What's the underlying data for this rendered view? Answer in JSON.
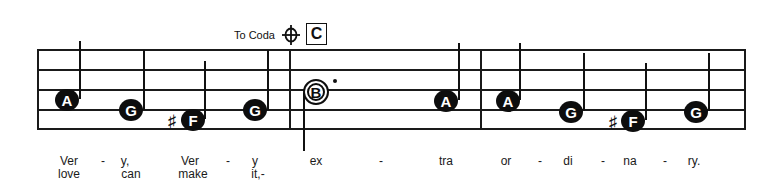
{
  "score": {
    "coda_marker": {
      "label": "To Coda",
      "icon": "coda-icon"
    },
    "rehearsal_mark": "C",
    "staff": {
      "lines": 5,
      "left": 38,
      "right": 746,
      "line_y": [
        50,
        70,
        90,
        110,
        129
      ]
    },
    "barlines_x": [
      38,
      290,
      481,
      745
    ],
    "notes": [
      {
        "letter": "A",
        "type": "quarter",
        "accidental": "",
        "x": 66,
        "y": 100,
        "stem": "up"
      },
      {
        "letter": "G",
        "type": "quarter",
        "accidental": "",
        "x": 131,
        "y": 110,
        "stem": "up"
      },
      {
        "letter": "F",
        "type": "quarter",
        "accidental": "♯",
        "x": 193,
        "y": 120,
        "stem": "up"
      },
      {
        "letter": "G",
        "type": "quarter",
        "accidental": "",
        "x": 255,
        "y": 110,
        "stem": "up"
      },
      {
        "letter": "B",
        "type": "dotted-half",
        "accidental": "",
        "x": 316,
        "y": 92,
        "stem": "down"
      },
      {
        "letter": "A",
        "type": "quarter",
        "accidental": "",
        "x": 446,
        "y": 101,
        "stem": "up"
      },
      {
        "letter": "A",
        "type": "quarter",
        "accidental": "",
        "x": 508,
        "y": 101,
        "stem": "up"
      },
      {
        "letter": "G",
        "type": "quarter",
        "accidental": "",
        "x": 571,
        "y": 112,
        "stem": "up"
      },
      {
        "letter": "F",
        "type": "quarter",
        "accidental": "♯",
        "x": 633,
        "y": 121,
        "stem": "up"
      },
      {
        "letter": "G",
        "type": "quarter",
        "accidental": "",
        "x": 696,
        "y": 112,
        "stem": "up"
      }
    ],
    "lyrics": {
      "verse1": [
        {
          "text": "Ver",
          "x": 69
        },
        {
          "text": "-",
          "x": 103
        },
        {
          "text": "y,",
          "x": 125
        },
        {
          "text": "Ver",
          "x": 190
        },
        {
          "text": "-",
          "x": 228
        },
        {
          "text": "y",
          "x": 255
        },
        {
          "text": "ex",
          "x": 316
        },
        {
          "text": "-",
          "x": 381
        },
        {
          "text": "tra",
          "x": 446
        },
        {
          "text": "or",
          "x": 506
        },
        {
          "text": "-",
          "x": 540
        },
        {
          "text": "di",
          "x": 568
        },
        {
          "text": "-",
          "x": 603
        },
        {
          "text": "na",
          "x": 630
        },
        {
          "text": "-",
          "x": 665
        },
        {
          "text": "ry.",
          "x": 694
        }
      ],
      "verse2": [
        {
          "text": "love",
          "x": 69
        },
        {
          "text": "can",
          "x": 131
        },
        {
          "text": "make",
          "x": 193
        },
        {
          "text": "it,-",
          "x": 258
        }
      ]
    }
  }
}
